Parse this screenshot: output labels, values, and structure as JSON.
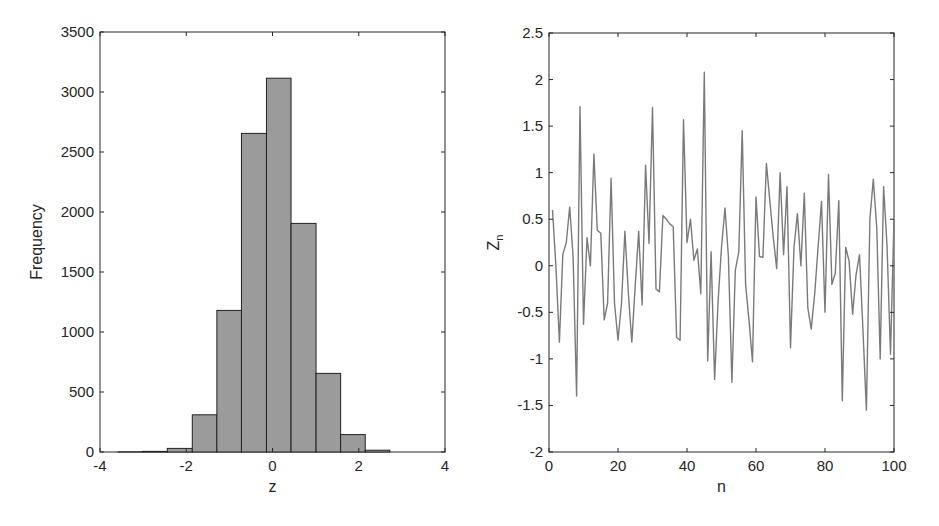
{
  "chart_data": [
    {
      "type": "bar",
      "subtype": "histogram",
      "title": "",
      "xlabel": "z",
      "ylabel": "Frequency",
      "xlim": [
        -4,
        4
      ],
      "ylim": [
        0,
        3500
      ],
      "xticks": [
        -4,
        -2,
        0,
        2,
        4
      ],
      "xtick_labels": [
        "-4",
        "-2",
        "0",
        "2",
        "4"
      ],
      "yticks": [
        0,
        500,
        1000,
        1500,
        2000,
        2500,
        3000,
        3500
      ],
      "ytick_labels": [
        "0",
        "500",
        "1000",
        "1500",
        "2000",
        "2500",
        "3000",
        "3500"
      ],
      "bin_edges": [
        -3.58,
        -3.01,
        -2.44,
        -1.86,
        -1.29,
        -0.72,
        -0.14,
        0.43,
        1.01,
        1.58,
        2.15,
        2.72
      ],
      "values": [
        1,
        5,
        30,
        310,
        1180,
        2655,
        3115,
        1905,
        655,
        145,
        15
      ],
      "bar_color": "#9b9b9b",
      "edge_color": "#222222",
      "grid": false
    },
    {
      "type": "line",
      "title": "",
      "xlabel": "n",
      "ylabel": "Z",
      "ylabel_subscript": "n",
      "xlim": [
        0,
        100
      ],
      "ylim": [
        -2,
        2.5
      ],
      "xticks": [
        0,
        20,
        40,
        60,
        80,
        100
      ],
      "xtick_labels": [
        "0",
        "20",
        "40",
        "60",
        "80",
        "100"
      ],
      "yticks": [
        -2,
        -1.5,
        -1,
        -0.5,
        0,
        0.5,
        1,
        1.5,
        2,
        2.5
      ],
      "ytick_labels": [
        "-2",
        "-1.5",
        "-1",
        "-0.5",
        "0",
        "0.5",
        "1",
        "1.5",
        "2",
        "2.5"
      ],
      "x": [
        1,
        2,
        3,
        4,
        5,
        6,
        7,
        8,
        9,
        10,
        11,
        12,
        13,
        14,
        15,
        16,
        17,
        18,
        19,
        20,
        21,
        22,
        23,
        24,
        25,
        26,
        27,
        28,
        29,
        30,
        31,
        32,
        33,
        34,
        35,
        36,
        37,
        38,
        39,
        40,
        41,
        42,
        43,
        44,
        45,
        46,
        47,
        48,
        49,
        50,
        51,
        52,
        53,
        54,
        55,
        56,
        57,
        58,
        59,
        60,
        61,
        62,
        63,
        64,
        65,
        66,
        67,
        68,
        69,
        70,
        71,
        72,
        73,
        74,
        75,
        76,
        77,
        78,
        79,
        80,
        81,
        82,
        83,
        84,
        85,
        86,
        87,
        88,
        89,
        90,
        91,
        92,
        93,
        94,
        95,
        96,
        97,
        98,
        99,
        100
      ],
      "values": [
        0.6,
        0.0,
        -0.82,
        0.12,
        0.25,
        0.63,
        0.1,
        -1.4,
        1.71,
        -0.63,
        0.3,
        0.0,
        1.2,
        0.38,
        0.35,
        -0.58,
        -0.4,
        0.94,
        -0.4,
        -0.8,
        -0.4,
        0.37,
        -0.3,
        -0.82,
        -0.2,
        0.37,
        -0.42,
        1.08,
        0.24,
        1.7,
        -0.25,
        -0.28,
        0.54,
        0.5,
        0.45,
        0.42,
        -0.77,
        -0.8,
        1.57,
        0.25,
        0.5,
        0.06,
        0.18,
        -0.3,
        2.08,
        -1.02,
        0.15,
        -1.22,
        -0.4,
        0.2,
        0.62,
        0.1,
        -1.25,
        -0.05,
        0.15,
        1.45,
        -0.2,
        -0.6,
        -1.03,
        0.74,
        0.1,
        0.09,
        1.1,
        0.7,
        0.3,
        -0.03,
        1.0,
        0.12,
        0.85,
        -0.88,
        0.2,
        0.56,
        0.0,
        0.78,
        -0.45,
        -0.68,
        -0.3,
        0.2,
        0.69,
        -0.5,
        0.98,
        -0.2,
        -0.08,
        0.7,
        -1.45,
        0.2,
        0.05,
        -0.52,
        -0.1,
        0.12,
        -0.7,
        -1.55,
        0.5,
        0.93,
        0.4,
        -1.0,
        0.85,
        0.2,
        -0.95,
        0.5
      ],
      "line_color": "#7a7a7a",
      "grid": false
    }
  ],
  "layout": {
    "left_axes": {
      "x": 100,
      "y": 32,
      "w": 345,
      "h": 420
    },
    "right_axes": {
      "x": 549,
      "y": 33,
      "w": 345,
      "h": 419
    }
  }
}
